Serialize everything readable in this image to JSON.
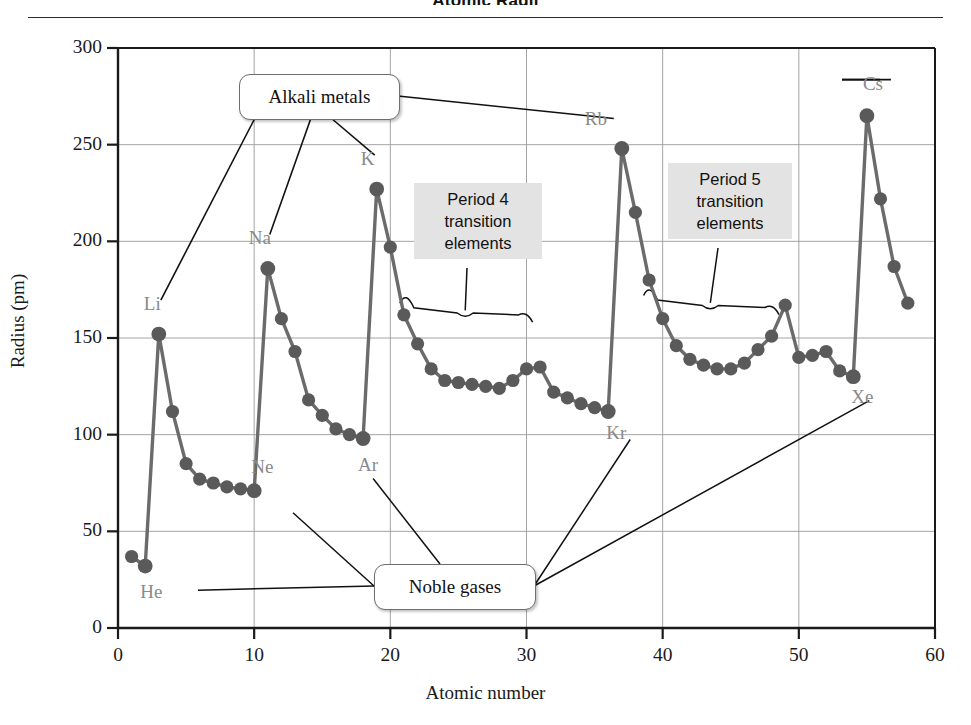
{
  "chart_title": "Atomic Radii",
  "axis": {
    "xlabel": "Atomic number",
    "ylabel": "Radius (pm)",
    "xticks": [
      "0",
      "10",
      "20",
      "30",
      "40",
      "50",
      "60"
    ],
    "yticks": [
      "0",
      "50",
      "100",
      "150",
      "200",
      "250",
      "300"
    ]
  },
  "callouts": {
    "alkali": "Alkali metals",
    "noble": "Noble gases",
    "period4": "Period 4\ntransition\nelements",
    "period5": "Period 5\ntransition\nelements"
  },
  "point_labels": [
    {
      "text": "He",
      "x": 2,
      "y": 32,
      "dx": 6,
      "dy": 26
    },
    {
      "text": "Li",
      "x": 3,
      "y": 152,
      "dx": -4,
      "dy": -30
    },
    {
      "text": "Ne",
      "x": 10,
      "y": 71,
      "dx": 8,
      "dy": -24
    },
    {
      "text": "Na",
      "x": 11,
      "y": 186,
      "dx": -8,
      "dy": -30
    },
    {
      "text": "Ar",
      "x": 18,
      "y": 98,
      "dx": 6,
      "dy": 26
    },
    {
      "text": "K",
      "x": 19,
      "y": 227,
      "dx": -5,
      "dy": -30
    },
    {
      "text": "Kr",
      "x": 36,
      "y": 112,
      "dx": 9,
      "dy": 22
    },
    {
      "text": "Rb",
      "x": 37,
      "y": 248,
      "dx": -26,
      "dy": -30
    },
    {
      "text": "Xe",
      "x": 54,
      "y": 130,
      "dx": 9,
      "dy": 20
    },
    {
      "text": "Cs",
      "x": 55,
      "y": 265,
      "dx": 7,
      "dy": -32
    }
  ],
  "colors": {
    "line": "#6b6b6b",
    "marker": "#5a5a5a",
    "grid": "#9a9a9a",
    "axis": "#1a1a1a",
    "label_text": "#8a8a8a",
    "callout_bg": "#ffffff",
    "gbox_bg": "#e3e3e3"
  },
  "chart_data": {
    "type": "line",
    "title": "Atomic Radii",
    "xlabel": "Atomic number",
    "ylabel": "Radius (pm)",
    "xlim": [
      0,
      60
    ],
    "ylim": [
      0,
      300
    ],
    "xtick_step": 10,
    "ytick_step": 50,
    "grid": true,
    "legend": "none",
    "marker": "circle",
    "series": [
      {
        "name": "Atomic radius",
        "x": [
          1,
          2,
          3,
          4,
          5,
          6,
          7,
          8,
          9,
          10,
          11,
          12,
          13,
          14,
          15,
          16,
          17,
          18,
          19,
          20,
          21,
          22,
          23,
          24,
          25,
          26,
          27,
          28,
          29,
          30,
          31,
          32,
          33,
          34,
          35,
          36,
          37,
          38,
          39,
          40,
          41,
          42,
          43,
          44,
          45,
          46,
          47,
          48,
          49,
          50,
          51,
          52,
          53,
          54,
          55,
          56,
          57,
          58
        ],
        "y": [
          37,
          32,
          152,
          112,
          85,
          77,
          75,
          73,
          72,
          71,
          186,
          160,
          143,
          118,
          110,
          103,
          100,
          98,
          227,
          197,
          162,
          147,
          134,
          128,
          127,
          126,
          125,
          124,
          128,
          134,
          135,
          122,
          119,
          116,
          114,
          112,
          248,
          215,
          180,
          160,
          146,
          139,
          136,
          134,
          134,
          137,
          144,
          151,
          167,
          140,
          141,
          143,
          133,
          130,
          265,
          222,
          187,
          168
        ],
        "labels": [
          "H",
          "He",
          "Li",
          "Be",
          "B",
          "C",
          "N",
          "O",
          "F",
          "Ne",
          "Na",
          "Mg",
          "Al",
          "Si",
          "P",
          "S",
          "Cl",
          "Ar",
          "K",
          "Ca",
          "Sc",
          "Ti",
          "V",
          "Cr",
          "Mn",
          "Fe",
          "Co",
          "Ni",
          "Cu",
          "Zn",
          "Ga",
          "Ge",
          "As",
          "Se",
          "Br",
          "Kr",
          "Rb",
          "Sr",
          "Y",
          "Zr",
          "Nb",
          "Mo",
          "Tc",
          "Ru",
          "Rh",
          "Pd",
          "Ag",
          "Cd",
          "In",
          "Sn",
          "Sb",
          "Te",
          "I",
          "Xe",
          "Cs",
          "Ba",
          "La",
          "Ce"
        ]
      }
    ],
    "annotations": [
      {
        "text": "Alkali metals",
        "points": [
          "Li",
          "Na",
          "K",
          "Rb",
          "Cs"
        ]
      },
      {
        "text": "Noble gases",
        "points": [
          "He",
          "Ne",
          "Ar",
          "Kr",
          "Xe"
        ]
      },
      {
        "text": "Period 4 transition elements",
        "range": [
          21,
          30
        ]
      },
      {
        "text": "Period 5 transition elements",
        "range": [
          39,
          48
        ]
      }
    ]
  }
}
